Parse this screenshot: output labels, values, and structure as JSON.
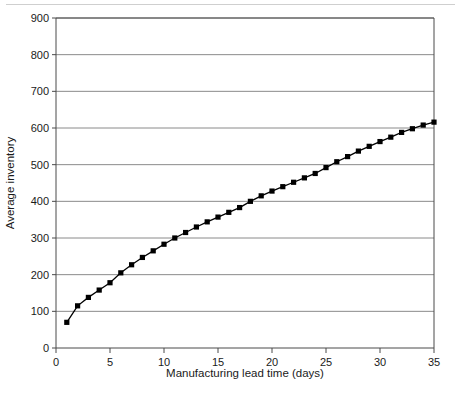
{
  "chart_data": {
    "type": "line",
    "title": "",
    "subtitle": "",
    "xlabel": "Manufacturing lead time (days)",
    "ylabel": "Average inventory",
    "xlim": [
      0,
      35
    ],
    "ylim": [
      0,
      900
    ],
    "xticks": [
      0,
      5,
      10,
      15,
      20,
      25,
      30,
      35
    ],
    "xtick_labels": [
      "0",
      "5",
      "10",
      "15",
      "20",
      "25",
      "30",
      "35"
    ],
    "yticks": [
      0,
      100,
      200,
      300,
      400,
      500,
      600,
      700,
      800,
      900
    ],
    "ytick_labels": [
      "0",
      "100",
      "200",
      "300",
      "400",
      "500",
      "600",
      "700",
      "800",
      "900"
    ],
    "grid": "horizontal",
    "grid_color": "#8a8a8a",
    "legend": "none",
    "marker": "square",
    "marker_color": "#000000",
    "line_color": "#000000",
    "annotations": [],
    "series": [
      {
        "name": "Average inventory",
        "x": [
          1,
          2,
          3,
          4,
          5,
          6,
          7,
          8,
          9,
          10,
          11,
          12,
          13,
          14,
          15,
          16,
          17,
          18,
          19,
          20,
          21,
          22,
          23,
          24,
          25,
          26,
          27,
          28,
          29,
          30,
          31,
          32,
          33,
          34,
          35
        ],
        "values": [
          70,
          115,
          138,
          158,
          178,
          205,
          227,
          247,
          265,
          283,
          300,
          315,
          330,
          344,
          357,
          370,
          383,
          400,
          415,
          428,
          440,
          452,
          464,
          476,
          492,
          508,
          522,
          537,
          550,
          563,
          575,
          588,
          598,
          608,
          616
        ]
      }
    ]
  }
}
